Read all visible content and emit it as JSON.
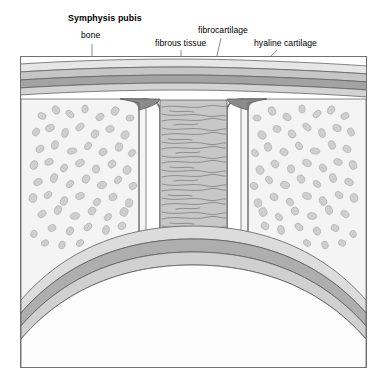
{
  "figure": {
    "title": "Symphysis pubis",
    "type": "anatomical-cross-section-illustration",
    "frame": {
      "x": 20,
      "y": 56,
      "width": 347,
      "height": 312,
      "border_color": "#6b6b6b",
      "background": "#ffffff"
    },
    "labels": [
      {
        "id": "symphysis",
        "text": "Symphysis pubis",
        "bold": true,
        "x": 68,
        "y": 14,
        "leader": null
      },
      {
        "id": "bone",
        "text": "bone",
        "bold": false,
        "x": 81,
        "y": 31,
        "leader": {
          "type": "line",
          "points": [
            [
              92,
              44
            ],
            [
              92,
              122
            ]
          ]
        }
      },
      {
        "id": "fibrous_tissue",
        "text": "fibrous tissue",
        "bold": false,
        "x": 155,
        "y": 39,
        "leader": {
          "type": "line",
          "points": [
            [
              181,
              50
            ],
            [
              181,
              150
            ]
          ]
        }
      },
      {
        "id": "fibrocartilage",
        "text": "fibrocartilage",
        "bold": false,
        "x": 198,
        "y": 26,
        "leader": {
          "type": "line",
          "points": [
            [
              221,
              38
            ],
            [
              207,
              100
            ]
          ]
        }
      },
      {
        "id": "hyaline_cartilage",
        "text": "hyaline cartilage",
        "bold": false,
        "x": 254,
        "y": 39,
        "leader": {
          "type": "line",
          "points": [
            [
              277,
              50
            ],
            [
              228,
              99
            ]
          ]
        }
      }
    ],
    "colors": {
      "outline": "#5a5a5a",
      "frame_border": "#6e6e6e",
      "band_light": "#e2e2e2",
      "band_mid": "#c9c9c9",
      "band_dark": "#a8a8a8",
      "band_darkest": "#9a9a9a",
      "cartilage_dark": "#8e8e8e",
      "fibrous_fill": "#c4c4c4",
      "fibrous_stroke": "#6a6a6a",
      "bone_bg": "#f2f2f2",
      "trabecula_fill": "#c9c9c9",
      "trabecula_stroke": "#a5a5a5",
      "arch_band_a": "#d8d8d8",
      "arch_band_b": "#b4b4b4",
      "arch_band_c": "#9e9e9e",
      "arch_inner": "#fafafa",
      "text": "#000000",
      "leader": "#6a6a6a",
      "page_background": "#ffffff"
    },
    "structures": [
      {
        "name": "superior-horizontal-bands",
        "description": "Four stacked horizontal tissue layers spanning full width above the joint"
      },
      {
        "name": "left-bone-block",
        "description": "Cancellous bone with irregular trabecular blobs, left pubic bone"
      },
      {
        "name": "right-bone-block",
        "description": "Cancellous bone with irregular trabecular blobs, right pubic bone"
      },
      {
        "name": "left-hyaline-cartilage",
        "description": "Dark vertical band on left side of joint space"
      },
      {
        "name": "right-hyaline-cartilage",
        "description": "Dark vertical band on right side of joint space"
      },
      {
        "name": "central-fibrocartilage",
        "description": "Central interpubic disc with wavy horizontal fibre lines"
      },
      {
        "name": "pubic-arch",
        "description": "Large inferior arc of layered cortical bands forming the pubic arch"
      }
    ]
  }
}
